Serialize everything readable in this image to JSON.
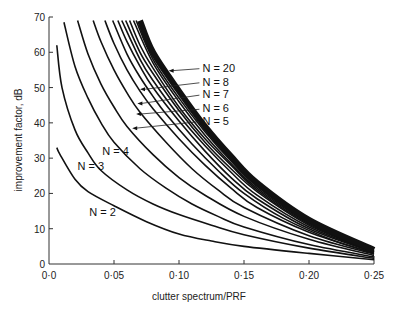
{
  "chart_data": {
    "type": "line",
    "title": "",
    "xlabel": "clutter spectrum/PRF",
    "ylabel": "improvement factor, dB",
    "xlim": [
      0,
      0.25
    ],
    "ylim": [
      0,
      70
    ],
    "x_ticks": [
      0,
      0.05,
      0.1,
      0.15,
      0.2,
      0.25
    ],
    "x_tick_labels": [
      "0·0",
      "0·05",
      "0·10",
      "0·15",
      "0·20",
      "0·25"
    ],
    "y_ticks": [
      0,
      10,
      20,
      30,
      40,
      50,
      60,
      70
    ],
    "y_tick_labels": [
      "0",
      "10",
      "20",
      "30",
      "40",
      "50",
      "60",
      "70"
    ],
    "grid": false,
    "legend": "inline labels with leader arrows",
    "series": [
      {
        "name": "N = 2",
        "points": [
          [
            0.006,
            33
          ],
          [
            0.0085,
            31
          ],
          [
            0.02,
            24
          ],
          [
            0.03,
            20.5
          ],
          [
            0.05,
            16.5
          ],
          [
            0.075,
            12
          ],
          [
            0.1,
            8.5
          ],
          [
            0.125,
            6.5
          ],
          [
            0.15,
            5
          ],
          [
            0.2,
            3
          ],
          [
            0.25,
            1.2
          ]
        ]
      },
      {
        "name": "N = 3",
        "points": [
          [
            0.006,
            62
          ],
          [
            0.01,
            50
          ],
          [
            0.02,
            38
          ],
          [
            0.03,
            31.5
          ],
          [
            0.04,
            26.5
          ],
          [
            0.06,
            21
          ],
          [
            0.08,
            17
          ],
          [
            0.1,
            14
          ],
          [
            0.125,
            11
          ],
          [
            0.15,
            8.3
          ],
          [
            0.2,
            4.5
          ],
          [
            0.25,
            1.6
          ]
        ]
      },
      {
        "name": "N = 4",
        "points": [
          [
            0.0115,
            68.5
          ],
          [
            0.02,
            56
          ],
          [
            0.03,
            47
          ],
          [
            0.04,
            40
          ],
          [
            0.05,
            34.5
          ],
          [
            0.07,
            27
          ],
          [
            0.09,
            21.5
          ],
          [
            0.11,
            17
          ],
          [
            0.13,
            13.5
          ],
          [
            0.15,
            10.5
          ],
          [
            0.2,
            5.5
          ],
          [
            0.25,
            2
          ]
        ]
      },
      {
        "name": "N = 5",
        "points": [
          [
            0.022,
            69
          ],
          [
            0.03,
            59.5
          ],
          [
            0.04,
            51
          ],
          [
            0.05,
            44.5
          ],
          [
            0.06,
            39
          ],
          [
            0.08,
            31
          ],
          [
            0.1,
            24.5
          ],
          [
            0.12,
            19.5
          ],
          [
            0.15,
            13.5
          ],
          [
            0.2,
            7
          ],
          [
            0.25,
            2.4
          ]
        ]
      },
      {
        "name": "N = 6",
        "points": [
          [
            0.034,
            69
          ],
          [
            0.04,
            63
          ],
          [
            0.05,
            55
          ],
          [
            0.06,
            48.5
          ],
          [
            0.07,
            43
          ],
          [
            0.09,
            34.5
          ],
          [
            0.11,
            27
          ],
          [
            0.13,
            21
          ],
          [
            0.15,
            16
          ],
          [
            0.2,
            8
          ],
          [
            0.25,
            2.8
          ]
        ]
      },
      {
        "name": "N = 7",
        "points": [
          [
            0.043,
            69
          ],
          [
            0.05,
            62.5
          ],
          [
            0.06,
            55
          ],
          [
            0.07,
            49
          ],
          [
            0.08,
            44
          ],
          [
            0.1,
            35.5
          ],
          [
            0.12,
            28
          ],
          [
            0.14,
            21.5
          ],
          [
            0.16,
            16
          ],
          [
            0.2,
            9
          ],
          [
            0.25,
            3
          ]
        ]
      },
      {
        "name": "N = 8",
        "points": [
          [
            0.049,
            69
          ],
          [
            0.06,
            59.5
          ],
          [
            0.07,
            53
          ],
          [
            0.08,
            47.5
          ],
          [
            0.09,
            42.5
          ],
          [
            0.11,
            34
          ],
          [
            0.13,
            26.5
          ],
          [
            0.15,
            20
          ],
          [
            0.18,
            13
          ],
          [
            0.22,
            6.5
          ],
          [
            0.25,
            3.2
          ]
        ]
      },
      {
        "name": "N = 9",
        "points": [
          [
            0.053,
            69
          ],
          [
            0.06,
            63
          ],
          [
            0.07,
            56
          ],
          [
            0.08,
            50
          ],
          [
            0.1,
            40.5
          ],
          [
            0.12,
            32
          ],
          [
            0.14,
            24.5
          ],
          [
            0.16,
            18.5
          ],
          [
            0.2,
            10
          ],
          [
            0.25,
            3.3
          ]
        ]
      },
      {
        "name": "N = 10",
        "points": [
          [
            0.056,
            69
          ],
          [
            0.07,
            58
          ],
          [
            0.08,
            52
          ],
          [
            0.1,
            42
          ],
          [
            0.12,
            33.5
          ],
          [
            0.14,
            26
          ],
          [
            0.16,
            19.5
          ],
          [
            0.2,
            10.5
          ],
          [
            0.25,
            3.4
          ]
        ]
      },
      {
        "name": "N = 11",
        "points": [
          [
            0.059,
            69
          ],
          [
            0.07,
            60
          ],
          [
            0.08,
            54
          ],
          [
            0.1,
            43.5
          ],
          [
            0.12,
            34.5
          ],
          [
            0.14,
            27
          ],
          [
            0.16,
            20.5
          ],
          [
            0.2,
            11
          ],
          [
            0.25,
            3.5
          ]
        ]
      },
      {
        "name": "N = 12",
        "points": [
          [
            0.062,
            69
          ],
          [
            0.07,
            62
          ],
          [
            0.08,
            55.5
          ],
          [
            0.1,
            44.5
          ],
          [
            0.12,
            35.5
          ],
          [
            0.14,
            28
          ],
          [
            0.16,
            21
          ],
          [
            0.2,
            11.3
          ],
          [
            0.25,
            3.6
          ]
        ]
      },
      {
        "name": "N = 14",
        "points": [
          [
            0.065,
            69
          ],
          [
            0.08,
            57
          ],
          [
            0.1,
            46
          ],
          [
            0.12,
            36.5
          ],
          [
            0.14,
            28.5
          ],
          [
            0.16,
            21.5
          ],
          [
            0.2,
            11.6
          ],
          [
            0.25,
            3.7
          ]
        ]
      },
      {
        "name": "N = 16",
        "points": [
          [
            0.067,
            69
          ],
          [
            0.08,
            58
          ],
          [
            0.1,
            47
          ],
          [
            0.12,
            37.5
          ],
          [
            0.14,
            29.2
          ],
          [
            0.16,
            22
          ],
          [
            0.2,
            12
          ],
          [
            0.25,
            3.8
          ]
        ]
      },
      {
        "name": "N = 20",
        "band": true,
        "points": [
          [
            0.07,
            69
          ],
          [
            0.08,
            60
          ],
          [
            0.1,
            49
          ],
          [
            0.12,
            39
          ],
          [
            0.14,
            30.5
          ],
          [
            0.16,
            23
          ],
          [
            0.2,
            12.5
          ],
          [
            0.25,
            4
          ]
        ],
        "band_width_px": 6
      }
    ],
    "annotations": [
      {
        "text": "N = 20",
        "label_at": [
          0.118,
          54.5
        ],
        "arrow_to": [
          0.092,
          54.8
        ]
      },
      {
        "text": "N = 8",
        "label_at": [
          0.118,
          50.5
        ],
        "arrow_to": [
          0.07,
          49.5
        ]
      },
      {
        "text": "N = 7",
        "label_at": [
          0.118,
          47
        ],
        "arrow_to": [
          0.068,
          45.5
        ]
      },
      {
        "text": "N = 6",
        "label_at": [
          0.118,
          43
        ],
        "arrow_to": [
          0.067,
          42.5
        ]
      },
      {
        "text": "N = 5",
        "label_at": [
          0.118,
          39.5
        ],
        "arrow_to": [
          0.064,
          38.5
        ]
      },
      {
        "text": "N = 4",
        "label_at": [
          0.041,
          31
        ],
        "arrow_to": null
      },
      {
        "text": "N = 3",
        "label_at": [
          0.022,
          26.5
        ],
        "arrow_to": null
      },
      {
        "text": "N = 2",
        "label_at": [
          0.031,
          13.5
        ],
        "arrow_to": null
      }
    ]
  },
  "layout": {
    "plot_left_px": 49,
    "plot_right_px": 374,
    "plot_top_px": 17,
    "plot_bottom_px": 264
  }
}
